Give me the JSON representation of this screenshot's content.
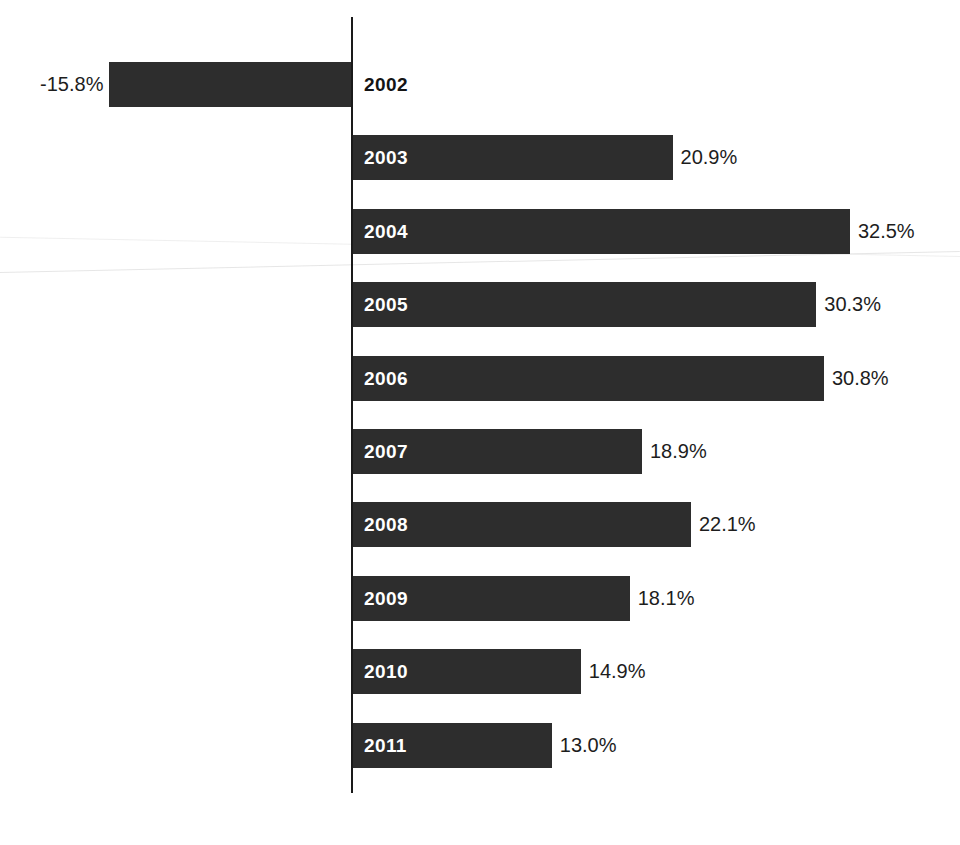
{
  "chart_data": {
    "type": "bar",
    "orientation": "horizontal",
    "title": "",
    "subtitle": "",
    "xlabel": "",
    "ylabel": "",
    "grid": false,
    "legend": null,
    "value_suffix": "%",
    "categories": [
      "2002",
      "2003",
      "2004",
      "2005",
      "2006",
      "2007",
      "2008",
      "2009",
      "2010",
      "2011"
    ],
    "values": [
      -15.8,
      20.9,
      32.5,
      30.3,
      30.8,
      18.9,
      22.1,
      18.1,
      14.9,
      13.0
    ],
    "value_labels": [
      "-15.8%",
      "20.9%",
      "32.5%",
      "30.3%",
      "30.8%",
      "18.9%",
      "22.1%",
      "18.1%",
      "14.9%",
      "13.0%"
    ],
    "xlim": [
      -17.5,
      40.0
    ],
    "baseline": 0,
    "colors": {
      "bar": "#2d2d2d",
      "axis": "#1a1a1a",
      "background": "#ffffff",
      "label_inside": "#ffffff",
      "label_outside": "#141414",
      "value_text": "#1d1d1d"
    }
  },
  "bars": [
    {
      "year": "2002",
      "value": -15.8,
      "value_label": "-15.8%",
      "label_placement": "outside",
      "value_side": "left"
    },
    {
      "year": "2003",
      "value": 20.9,
      "value_label": "20.9%",
      "label_placement": "inside",
      "value_side": "right"
    },
    {
      "year": "2004",
      "value": 32.5,
      "value_label": "32.5%",
      "label_placement": "inside",
      "value_side": "right"
    },
    {
      "year": "2005",
      "value": 30.3,
      "value_label": "30.3%",
      "label_placement": "inside",
      "value_side": "right"
    },
    {
      "year": "2006",
      "value": 30.8,
      "value_label": "30.8%",
      "label_placement": "inside",
      "value_side": "right"
    },
    {
      "year": "2007",
      "value": 18.9,
      "value_label": "18.9%",
      "label_placement": "inside",
      "value_side": "right"
    },
    {
      "year": "2008",
      "value": 22.1,
      "value_label": "22.1%",
      "label_placement": "inside",
      "value_side": "right"
    },
    {
      "year": "2009",
      "value": 18.1,
      "value_label": "18.1%",
      "label_placement": "inside",
      "value_side": "right"
    },
    {
      "year": "2010",
      "value": 14.9,
      "value_label": "14.9%",
      "label_placement": "inside",
      "value_side": "right"
    },
    {
      "year": "2011",
      "value": 13.0,
      "value_label": "13.0%",
      "label_placement": "inside",
      "value_side": "right"
    }
  ],
  "geometry": {
    "axis_x": 351,
    "axis_top": 17,
    "axis_bottom": 793,
    "axis_width": 2,
    "first_bar_top": 62,
    "bar_height": 45,
    "bar_pitch": 73.4,
    "px_per_unit": 15.29
  }
}
